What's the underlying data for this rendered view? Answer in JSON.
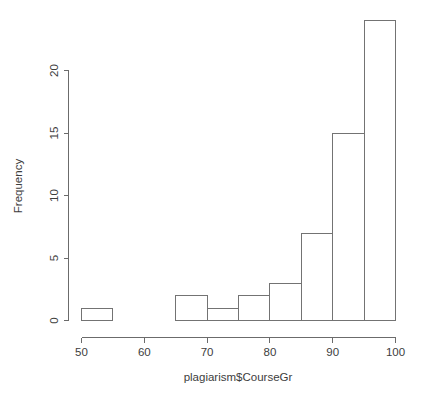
{
  "chart_data": {
    "type": "bar",
    "title": "",
    "subtitle": "",
    "xlabel": "plagiarism$CourseGr",
    "ylabel": "Frequency",
    "xlim": [
      50,
      100
    ],
    "ylim": [
      0,
      24
    ],
    "grid": false,
    "legend": "none",
    "bin_width": 5,
    "bin_edges": [
      50,
      55,
      60,
      65,
      70,
      75,
      80,
      85,
      90,
      95,
      100
    ],
    "categories": [
      "50-55",
      "55-60",
      "60-65",
      "65-70",
      "70-75",
      "75-80",
      "80-85",
      "85-90",
      "90-95",
      "95-100"
    ],
    "values": [
      1,
      0,
      0,
      2,
      1,
      2,
      3,
      7,
      15,
      24
    ],
    "xticks": [
      50,
      60,
      70,
      80,
      90,
      100
    ],
    "xtick_labels": [
      "50",
      "60",
      "70",
      "80",
      "90",
      "100"
    ],
    "yticks": [
      0,
      5,
      10,
      15,
      20
    ],
    "ytick_labels": [
      "0",
      "5",
      "10",
      "15",
      "20"
    ],
    "colors": {
      "bar_fill": "#ffffff",
      "bar_stroke": "#737373",
      "axis": "#6b6b6b",
      "text": "#3d3d3d",
      "background": "#ffffff"
    }
  },
  "axis_labels": {
    "x_title": "plagiarism$CourseGr",
    "y_title": "Frequency"
  },
  "ticks": {
    "x": [
      "50",
      "60",
      "70",
      "80",
      "90",
      "100"
    ],
    "y": [
      "0",
      "5",
      "10",
      "15",
      "20"
    ]
  }
}
